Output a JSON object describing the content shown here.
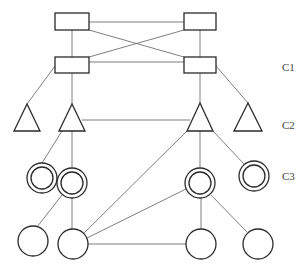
{
  "diagram": {
    "type": "hierarchical-network",
    "colors": {
      "line": "#707070",
      "node_stroke": "#2a2a2a",
      "background": "#ffffff",
      "label": "#444444"
    },
    "labels": [
      {
        "id": "c1",
        "text": "C1",
        "x": 282,
        "y": 71
      },
      {
        "id": "c2",
        "text": "C2",
        "x": 282,
        "y": 129
      },
      {
        "id": "c3",
        "text": "C3",
        "x": 282,
        "y": 180
      }
    ],
    "nodes": {
      "rect_top_left": {
        "shape": "rectangle",
        "x": 55,
        "y": 13,
        "w": 34,
        "h": 17
      },
      "rect_top_right": {
        "shape": "rectangle",
        "x": 184,
        "y": 13,
        "w": 32,
        "h": 17
      },
      "rect_mid_left": {
        "shape": "rectangle",
        "x": 55,
        "y": 57,
        "w": 34,
        "h": 16
      },
      "rect_mid_right": {
        "shape": "rectangle",
        "x": 184,
        "y": 57,
        "w": 32,
        "h": 16
      },
      "tri_1": {
        "shape": "triangle",
        "cx": 27,
        "top": 104,
        "bottom": 131,
        "half": 13
      },
      "tri_2": {
        "shape": "triangle",
        "cx": 72,
        "top": 104,
        "bottom": 131,
        "half": 13
      },
      "tri_3": {
        "shape": "triangle",
        "cx": 200,
        "top": 103,
        "bottom": 131,
        "half": 13
      },
      "tri_4": {
        "shape": "triangle",
        "cx": 248,
        "top": 103,
        "bottom": 131,
        "half": 14
      },
      "dcircle_1": {
        "shape": "double-circle",
        "cx": 42,
        "cy": 178,
        "r": 15
      },
      "dcircle_2": {
        "shape": "double-circle",
        "cx": 72,
        "cy": 183,
        "r": 15
      },
      "dcircle_3": {
        "shape": "double-circle",
        "cx": 200,
        "cy": 183,
        "r": 15
      },
      "dcircle_4": {
        "shape": "double-circle",
        "cx": 254,
        "cy": 176,
        "r": 15
      },
      "circle_1": {
        "shape": "circle",
        "cx": 33,
        "cy": 241,
        "r": 15
      },
      "circle_2": {
        "shape": "circle",
        "cx": 73,
        "cy": 244,
        "r": 15
      },
      "circle_3": {
        "shape": "circle",
        "cx": 201,
        "cy": 244,
        "r": 15
      },
      "circle_4": {
        "shape": "circle",
        "cx": 258,
        "cy": 244,
        "r": 15
      }
    },
    "edges": [
      [
        "rect_top_left",
        "rect_top_right"
      ],
      [
        "rect_top_left",
        "rect_mid_left"
      ],
      [
        "rect_top_left",
        "rect_mid_right"
      ],
      [
        "rect_top_right",
        "rect_mid_left"
      ],
      [
        "rect_top_right",
        "rect_mid_right"
      ],
      [
        "rect_mid_left",
        "rect_mid_right"
      ],
      [
        "rect_mid_left",
        "tri_1"
      ],
      [
        "rect_mid_left",
        "tri_2"
      ],
      [
        "rect_mid_right",
        "tri_3"
      ],
      [
        "rect_mid_right",
        "tri_4"
      ],
      [
        "tri_2",
        "tri_3"
      ],
      [
        "tri_2",
        "dcircle_1"
      ],
      [
        "tri_2",
        "dcircle_2"
      ],
      [
        "tri_3",
        "dcircle_3"
      ],
      [
        "tri_3",
        "dcircle_4"
      ],
      [
        "tri_3",
        "circle_2"
      ],
      [
        "dcircle_2",
        "circle_1"
      ],
      [
        "dcircle_2",
        "circle_2"
      ],
      [
        "dcircle_3",
        "circle_2"
      ],
      [
        "dcircle_3",
        "circle_3"
      ],
      [
        "dcircle_3",
        "circle_4"
      ],
      [
        "circle_2",
        "circle_3"
      ]
    ]
  }
}
